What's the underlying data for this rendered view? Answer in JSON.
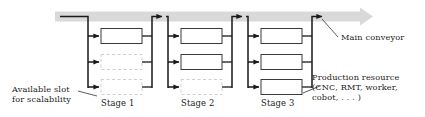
{
  "figure": {
    "type": "manufacturing-line-diagram",
    "colors": {
      "line": "#1a1a1a",
      "conveyor_band": "#d9d9d9",
      "resource_box_stroke": "#3a3a3a",
      "resource_box_fill": "#ffffff",
      "empty_slot_stroke": "#cfcfcf",
      "text": "#1a1a1a",
      "leader_line": "#4a4a4a"
    }
  },
  "annotations": {
    "main_conveyor": "Main conveyor",
    "available_slot_line1": "Available slot",
    "available_slot_line2": "for scalability",
    "production_resource_line1": "Production resource",
    "production_resource_line2": "(CNC, RMT, worker,",
    "production_resource_line3": "cobot, . . . )"
  },
  "stages": [
    {
      "label": "Stage 1",
      "slots": [
        {
          "index": 1,
          "state": "occupied"
        },
        {
          "index": 2,
          "state": "empty"
        },
        {
          "index": 3,
          "state": "empty"
        }
      ]
    },
    {
      "label": "Stage 2",
      "slots": [
        {
          "index": 1,
          "state": "occupied"
        },
        {
          "index": 2,
          "state": "occupied"
        },
        {
          "index": 3,
          "state": "empty"
        }
      ]
    },
    {
      "label": "Stage 3",
      "slots": [
        {
          "index": 1,
          "state": "occupied"
        },
        {
          "index": 2,
          "state": "occupied"
        },
        {
          "index": 3,
          "state": "occupied"
        }
      ]
    }
  ]
}
